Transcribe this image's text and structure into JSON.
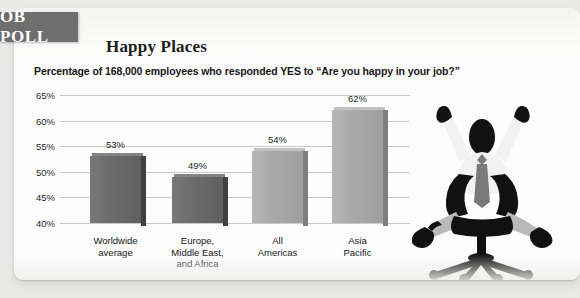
{
  "badge": {
    "label": "OB POLL"
  },
  "header": {
    "title": "Happy Places",
    "subtitle": "Percentage of 168,000 employees who responded YES to “Are you happy in your job?”"
  },
  "illustration": {
    "name": "celebrating-office-worker-silhouette",
    "alt": "Silhouette of a businessman in an office chair with arms raised in celebration"
  },
  "colors": {
    "badge_bg": "#6e6e6e",
    "card_bg": "#fdfdfd",
    "page_bg": "#e9e9e7",
    "bar_dark": "#6a6a6a",
    "bar_light": "#a8a8a8",
    "gridline": "#c9c9c9"
  },
  "chart_data": {
    "type": "bar",
    "title": "Happy Places",
    "subtitle": "Percentage of 168,000 employees who responded YES to “Are you happy in your job?”",
    "xlabel": "",
    "ylabel": "",
    "ylim": [
      40,
      65
    ],
    "yticks": [
      "40%",
      "45%",
      "50%",
      "55%",
      "60%",
      "65%"
    ],
    "ytick_values": [
      40,
      45,
      50,
      55,
      60,
      65
    ],
    "grid": true,
    "legend": "none",
    "categories": [
      "Worldwide average",
      "Europe, Middle East, and Africa",
      "All Americas",
      "Asia Pacific"
    ],
    "category_lines": [
      [
        "Worldwide",
        "average"
      ],
      [
        "Europe,",
        "Middle East,",
        "and Africa"
      ],
      [
        "All",
        "Americas"
      ],
      [
        "Asia",
        "Pacific"
      ]
    ],
    "values": [
      53,
      49,
      54,
      62
    ],
    "value_labels": [
      "53%",
      "49%",
      "54%",
      "62%"
    ],
    "bar_colors": [
      "#6a6a6a",
      "#6a6a6a",
      "#a8a8a8",
      "#a8a8a8"
    ]
  }
}
